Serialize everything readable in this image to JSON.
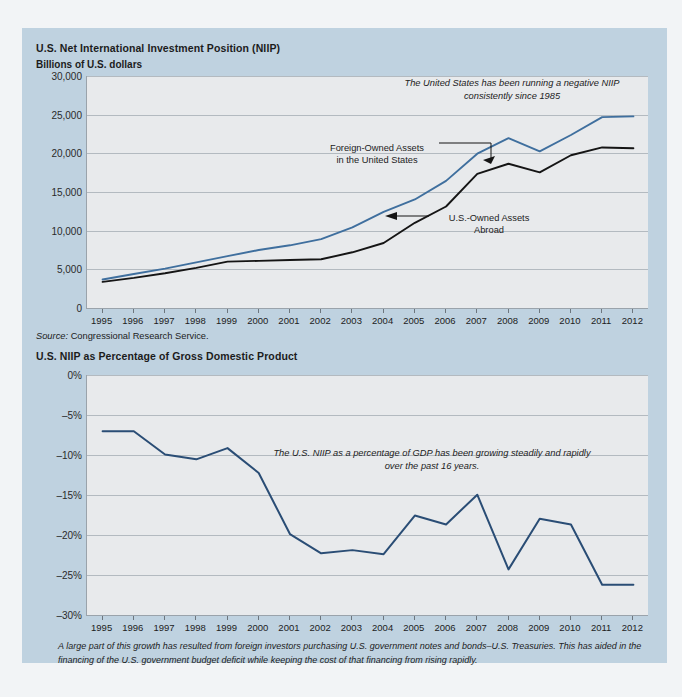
{
  "page": {
    "background_color": "#bfd2e0",
    "outer_background_color": "#f2f4f6",
    "plot_background_color": "#e8eaec"
  },
  "chart1": {
    "title": "U.S. Net International Investment Position (NIIP)",
    "subtitle": "Billions of U.S. dollars",
    "source": "Source:",
    "source_value": "Congressional Research Service.",
    "annotation": "The United States has been running a negative NIIP consistently since 1985",
    "label_foreign_line1": "Foreign-Owned Assets",
    "label_foreign_line2": "in the United States",
    "label_us_line1": "U.S.-Owned Assets",
    "label_us_line2": "Abroad",
    "yticks": [
      "30,000",
      "25,000",
      "20,000",
      "15,000",
      "10,000",
      "5,000",
      "0"
    ]
  },
  "chart2": {
    "title": "U.S. NIIP as Percentage of Gross Domestic Product",
    "annotation": "The U.S. NIIP as a percentage of GDP has been growing steadily and rapidly over the past 16 years.",
    "yticks": [
      "0%",
      "–5%",
      "–10%",
      "–15%",
      "–20%",
      "–25%",
      "–30%"
    ]
  },
  "footnote": "A large part of this growth has resulted from foreign investors purchasing U.S. government notes and bonds–U.S. Treasuries. This has aided in the financing of the U.S. government budget deficit while keeping the cost of that financing from rising rapidly.",
  "chart_data": [
    {
      "type": "line",
      "title": "U.S. Net International Investment Position (NIIP)",
      "xlabel": "",
      "ylabel": "Billions of U.S. dollars",
      "ylim": [
        0,
        30000
      ],
      "ytick_values": [
        0,
        5000,
        10000,
        15000,
        20000,
        25000,
        30000
      ],
      "grid": true,
      "legend": "inline-annotations",
      "x": [
        1995,
        1996,
        1997,
        1998,
        1999,
        2000,
        2001,
        2002,
        2003,
        2004,
        2005,
        2006,
        2007,
        2008,
        2009,
        2010,
        2011,
        2012
      ],
      "categories": [
        "1995",
        "1996",
        "1997",
        "1998",
        "1999",
        "2000",
        "2001",
        "2002",
        "2003",
        "2004",
        "2005",
        "2006",
        "2007",
        "2008",
        "2009",
        "2010",
        "2011",
        "2012"
      ],
      "series": [
        {
          "name": "Foreign-Owned Assets in the United States",
          "color": "#3f6f9e",
          "values": [
            3800,
            4500,
            5200,
            6000,
            6800,
            7600,
            8200,
            9000,
            10500,
            12500,
            14100,
            16500,
            20000,
            22000,
            20300,
            22400,
            24700,
            24800
          ]
        },
        {
          "name": "U.S.-Owned Assets Abroad",
          "color": "#151515",
          "values": [
            3500,
            4000,
            4600,
            5300,
            6100,
            6200,
            6300,
            6400,
            7300,
            8500,
            11100,
            13200,
            17400,
            18700,
            17600,
            19800,
            20800,
            20700
          ]
        }
      ]
    },
    {
      "type": "line",
      "title": "U.S. NIIP as Percentage of Gross Domestic Product",
      "xlabel": "",
      "ylabel": "",
      "ylim": [
        -30,
        0
      ],
      "ytick_values": [
        0,
        -5,
        -10,
        -15,
        -20,
        -25,
        -30
      ],
      "grid": true,
      "x": [
        1995,
        1996,
        1997,
        1998,
        1999,
        2000,
        2001,
        2002,
        2003,
        2004,
        2005,
        2006,
        2007,
        2008,
        2009,
        2010,
        2011,
        2012
      ],
      "categories": [
        "1995",
        "1996",
        "1997",
        "1998",
        "1999",
        "2000",
        "2001",
        "2002",
        "2003",
        "2004",
        "2005",
        "2006",
        "2007",
        "2008",
        "2009",
        "2010",
        "2011",
        "2012"
      ],
      "series": [
        {
          "name": "U.S. NIIP as Percentage of GDP",
          "color": "#2a4d75",
          "values": [
            -7.0,
            -7.0,
            -9.9,
            -10.5,
            -9.1,
            -12.2,
            -19.8,
            -22.2,
            -21.8,
            -22.3,
            -17.5,
            -18.6,
            -14.9,
            -24.2,
            -17.9,
            -18.6,
            -26.1,
            -26.1
          ]
        }
      ]
    }
  ]
}
